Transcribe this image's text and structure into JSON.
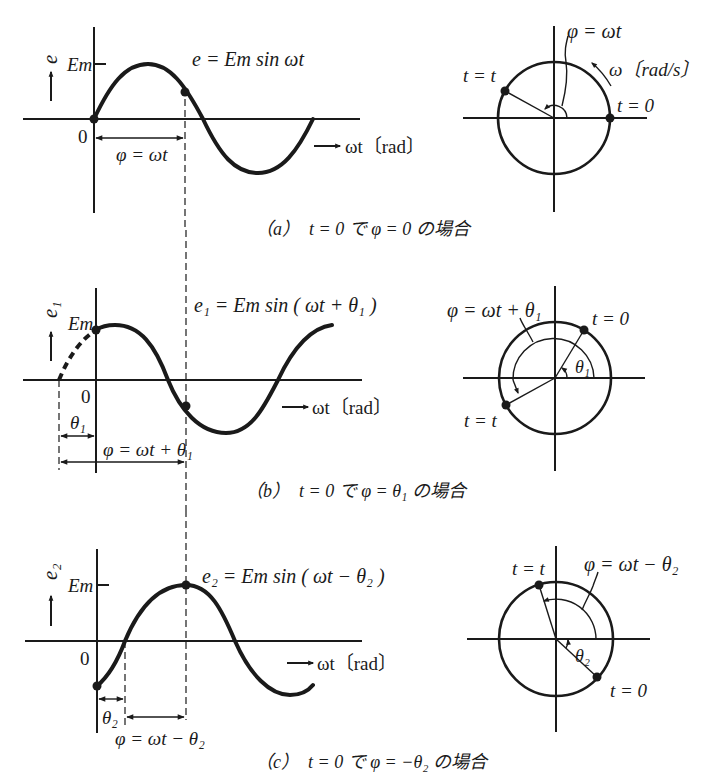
{
  "figure": {
    "panels": [
      {
        "id": "a",
        "waveform": {
          "y_axis_label": "e",
          "amplitude_label": "Em",
          "origin_label": "0",
          "equation": "e = Em sin ωt",
          "phase_label": "φ = ωt",
          "x_axis_label": "ωt〔rad〕"
        },
        "phasor": {
          "phase_label": "φ = ωt",
          "angular_velocity_label": "ω〔rad/s〕",
          "point_t": "t = t",
          "point_0": "t = 0"
        },
        "caption": "（a）　t = 0 で φ = 0 の場合"
      },
      {
        "id": "b",
        "waveform": {
          "y_axis_label": "e₁",
          "amplitude_label": "Em",
          "origin_label": "0",
          "equation": "e₁ = Em sin ( ωt + θ₁ )",
          "offset_label": "θ₁",
          "phase_label": "φ = ωt + θ₁",
          "x_axis_label": "ωt〔rad〕"
        },
        "phasor": {
          "phase_label": "φ = ωt + θ₁",
          "offset_label": "θ₁",
          "point_t": "t = t",
          "point_0": "t = 0"
        },
        "caption": "（b）　t = 0 で φ = θ₁ の場合"
      },
      {
        "id": "c",
        "waveform": {
          "y_axis_label": "e₂",
          "amplitude_label": "Em",
          "origin_label": "0",
          "equation": "e₂ = Em sin ( ωt − θ₂ )",
          "offset_label": "θ₂",
          "phase_label": "φ = ωt − θ₂",
          "x_axis_label": "ωt〔rad〕"
        },
        "phasor": {
          "phase_label": "φ = ωt − θ₂",
          "offset_label": "θ₂",
          "point_t": "t = t",
          "point_0": "t = 0"
        },
        "caption": "（c）　t = 0 で φ = −θ₂ の場合"
      }
    ]
  }
}
